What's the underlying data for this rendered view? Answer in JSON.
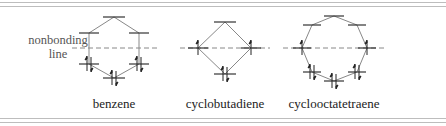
{
  "labels": {
    "nonbonding_line_1": "nonbonding",
    "nonbonding_line_2": "line",
    "benzene": "benzene",
    "cyclobutadiene": "cyclobutadiene",
    "cyclooctatetraene": "cyclooctatetraene"
  },
  "colors": {
    "level": "#333333",
    "connector": "#888888",
    "dashed": "#888888",
    "rule": "#bdbdbd",
    "text": "#222222"
  },
  "molecules": [
    {
      "name": "benzene",
      "nonbonding_y": 48,
      "levels": [
        {
          "x": 114,
          "y": 17,
          "electrons": 0
        },
        {
          "x": 89,
          "y": 33,
          "electrons": 0
        },
        {
          "x": 139,
          "y": 33,
          "electrons": 0
        },
        {
          "x": 89,
          "y": 64,
          "electrons": 2
        },
        {
          "x": 139,
          "y": 64,
          "electrons": 2
        },
        {
          "x": 114,
          "y": 78,
          "electrons": 2
        }
      ]
    },
    {
      "name": "cyclobutadiene",
      "nonbonding_y": 48,
      "levels": [
        {
          "x": 225,
          "y": 22,
          "electrons": 0
        },
        {
          "x": 198,
          "y": 48,
          "electrons": 1
        },
        {
          "x": 251,
          "y": 48,
          "electrons": 1
        },
        {
          "x": 225,
          "y": 74,
          "electrons": 2
        }
      ]
    },
    {
      "name": "cyclooctatetraene",
      "nonbonding_y": 48,
      "levels": [
        {
          "x": 334,
          "y": 16,
          "electrons": 0
        },
        {
          "x": 312,
          "y": 25,
          "electrons": 0
        },
        {
          "x": 357,
          "y": 25,
          "electrons": 0
        },
        {
          "x": 302,
          "y": 48,
          "electrons": 1
        },
        {
          "x": 367,
          "y": 48,
          "electrons": 1
        },
        {
          "x": 312,
          "y": 72,
          "electrons": 2
        },
        {
          "x": 357,
          "y": 72,
          "electrons": 2
        },
        {
          "x": 334,
          "y": 81,
          "electrons": 2
        }
      ]
    }
  ]
}
